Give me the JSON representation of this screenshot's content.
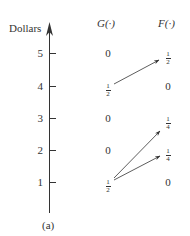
{
  "figure": {
    "axis_label": "Dollars",
    "caption": "(a)",
    "column_headers": {
      "g": "G(·)",
      "f": "F(·)"
    },
    "ticks": [
      {
        "value": "5",
        "y": 53
      },
      {
        "value": "4",
        "y": 86
      },
      {
        "value": "3",
        "y": 118
      },
      {
        "value": "2",
        "y": 150
      },
      {
        "value": "1",
        "y": 182
      }
    ],
    "rows": [
      {
        "dollars": "5",
        "g": {
          "type": "int",
          "text": "0"
        },
        "f": {
          "type": "frac",
          "num": "1",
          "den": "2"
        }
      },
      {
        "dollars": "4",
        "g": {
          "type": "frac",
          "num": "1",
          "den": "2"
        },
        "f": {
          "type": "int",
          "text": "0"
        }
      },
      {
        "dollars": "3",
        "g": {
          "type": "int",
          "text": "0"
        },
        "f": {
          "type": "frac",
          "num": "1",
          "den": "4"
        }
      },
      {
        "dollars": "2",
        "g": {
          "type": "int",
          "text": "0"
        },
        "f": {
          "type": "frac",
          "num": "1",
          "den": "4"
        }
      },
      {
        "dollars": "1",
        "g": {
          "type": "frac",
          "num": "1",
          "den": "2"
        },
        "f": {
          "type": "int",
          "text": "0"
        }
      }
    ],
    "arrows": [
      {
        "from": "G(4)",
        "to": "F(5)"
      },
      {
        "from": "G(1)",
        "to": "F(3)"
      },
      {
        "from": "G(1)",
        "to": "F(2)"
      }
    ],
    "colors": {
      "ink": "#333333",
      "background": "#ffffff"
    }
  }
}
